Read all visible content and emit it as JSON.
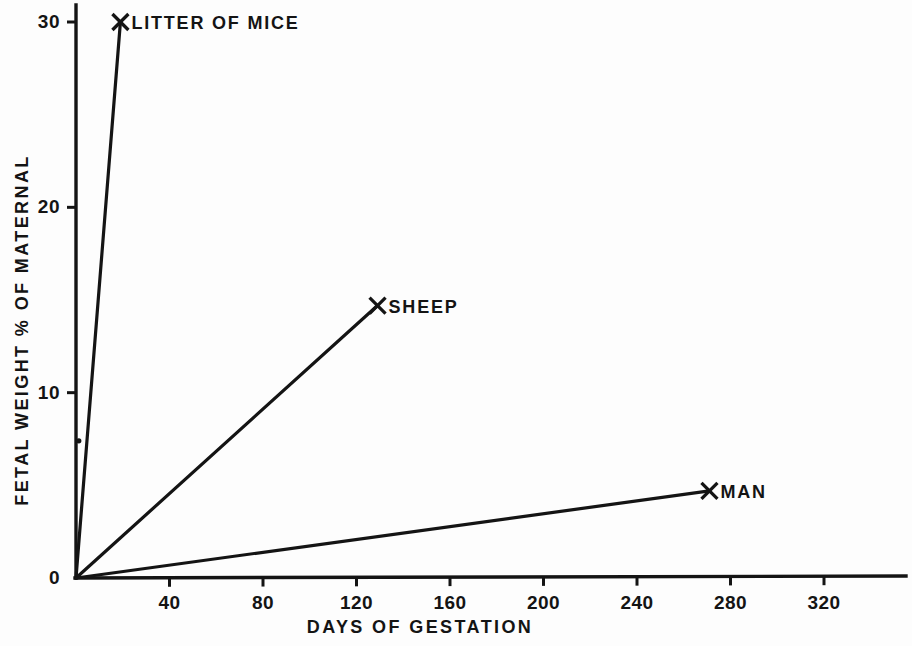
{
  "chart_data": {
    "type": "line",
    "title": "",
    "subtitle": "",
    "xlabel": "DAYS OF GESTATION",
    "ylabel": "FETAL WEIGHT % OF MATERNAL",
    "xlim": [
      0,
      348
    ],
    "ylim": [
      0,
      31
    ],
    "grid": false,
    "legend_position": "inline-annotations",
    "xticks": [
      {
        "value": 40,
        "label": "40"
      },
      {
        "value": 80,
        "label": "80"
      },
      {
        "value": 120,
        "label": "120"
      },
      {
        "value": 160,
        "label": "160"
      },
      {
        "value": 200,
        "label": "200"
      },
      {
        "value": 240,
        "label": "240"
      },
      {
        "value": 280,
        "label": "280"
      },
      {
        "value": 320,
        "label": "320"
      }
    ],
    "yticks": [
      {
        "value": 0,
        "label": "0"
      },
      {
        "value": 10,
        "label": "10"
      },
      {
        "value": 20,
        "label": "20"
      },
      {
        "value": 30,
        "label": "30"
      }
    ],
    "series": [
      {
        "name": "LITTER OF MICE",
        "marker": "X",
        "label_text": "LITTER OF MICE",
        "x": [
          0,
          19
        ],
        "y": [
          0,
          30.0
        ]
      },
      {
        "name": "SHEEP",
        "marker": "X",
        "label_text": "SHEEP",
        "x": [
          0,
          129
        ],
        "y": [
          0,
          14.7
        ]
      },
      {
        "name": "MAN",
        "marker": "X",
        "label_text": "MAN",
        "x": [
          0,
          271
        ],
        "y": [
          0,
          4.7
        ]
      }
    ],
    "annotations": [
      {
        "name": "stray-ink-dot",
        "x": 1.2,
        "y": 7.4
      }
    ]
  },
  "style": {
    "ink_color": "#141414",
    "background_color": "#fdfdfd"
  }
}
